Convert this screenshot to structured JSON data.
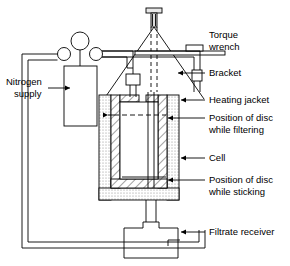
{
  "diagram": {
    "type": "schematic",
    "background_color": "#ffffff",
    "line_color": "#000000",
    "hatch_color": "#555555",
    "stipple_color": "#999999"
  },
  "labels": {
    "torque_wrench_line1": "Torque",
    "torque_wrench_line2": "wrench",
    "bracket": "Bracket",
    "heating_jacket": "Heating jacket",
    "disc_filtering_line1": "Position of disc",
    "disc_filtering_line2": "while filtering",
    "cell": "Cell",
    "disc_sticking_line1": "Position of disc",
    "disc_sticking_line2": "while sticking",
    "filtrate_receiver": "Filtrate receiver",
    "nitrogen_supply_line1": "Nitrogen",
    "nitrogen_supply_line2": "supply"
  },
  "components": {
    "bolt": "top-clamping-bolt",
    "wrench_bar": "torque-wrench-bar",
    "wrench_handle": "torque-wrench-handle",
    "bracket_frame": "triangular-bracket",
    "jacket": "heating-jacket",
    "cell_body": "pressure-cell",
    "disc_filtering": "disc-position-filtering",
    "disc_sticking": "disc-position-sticking",
    "gas_cylinder": "nitrogen-cylinder",
    "pressure_gauge": "pressure-gauge",
    "valve_left": "valve-left",
    "valve_right": "valve-right",
    "inlet_fitting": "gas-inlet-fitting",
    "receiver": "filtrate-receiver-vessel",
    "outlet_tube": "filtrate-outlet-tube",
    "gas_line": "nitrogen-gas-line"
  }
}
